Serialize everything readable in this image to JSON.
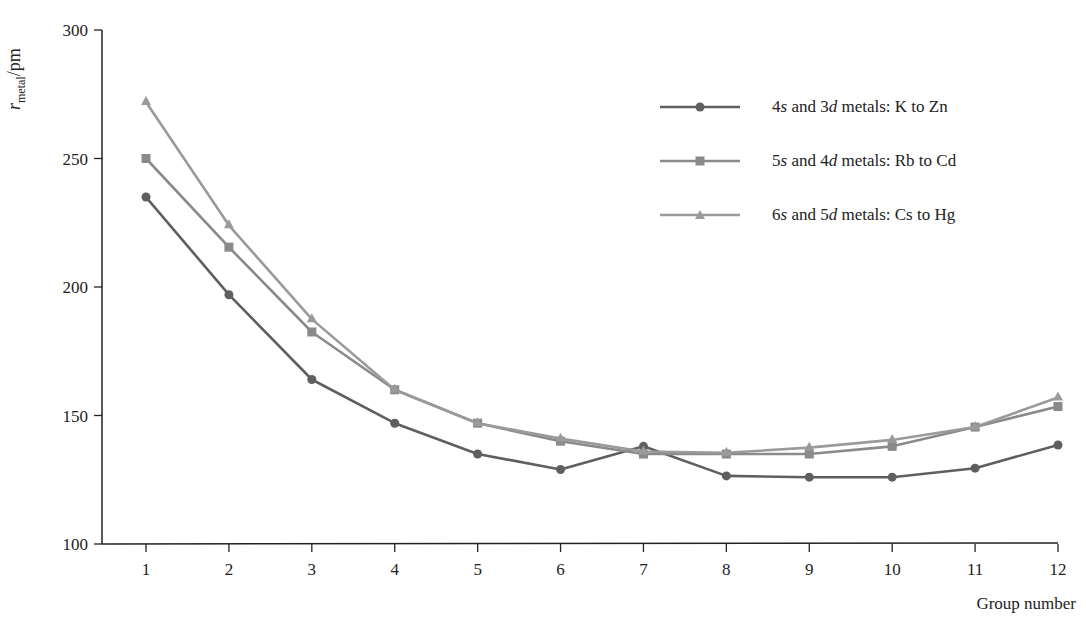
{
  "chart_data": {
    "type": "line",
    "title": "",
    "xlabel": "Group number",
    "ylabel": "r_metal/pm",
    "ylabel_parts": {
      "symbol": "r",
      "subscript": "metal",
      "unit": "/pm"
    },
    "x": [
      1,
      2,
      3,
      4,
      5,
      6,
      7,
      8,
      9,
      10,
      11,
      12
    ],
    "x_tick_labels": [
      "1",
      "2",
      "3",
      "4",
      "5",
      "6",
      "7",
      "8",
      "9",
      "10",
      "11",
      "12"
    ],
    "y_ticks": [
      100,
      150,
      200,
      250,
      300
    ],
    "y_tick_labels": [
      "100",
      "150",
      "200",
      "250",
      "300"
    ],
    "ylim": [
      100,
      300
    ],
    "xlim": [
      0.45,
      12
    ],
    "grid": false,
    "legend_position": "upper right",
    "series": [
      {
        "name": "4s and 3d metals: K to Zn",
        "marker": "circle",
        "color": "#5f5f5f",
        "values": [
          235,
          197,
          164,
          147,
          135,
          129,
          138,
          126.5,
          126,
          126,
          129.5,
          138.5
        ]
      },
      {
        "name": "5s and 4d metals: Rb to Cd",
        "marker": "square",
        "color": "#8a8a8a",
        "values": [
          250,
          215.5,
          182.5,
          160,
          147,
          140,
          135,
          135,
          135,
          138,
          145.5,
          153.5
        ]
      },
      {
        "name": "6s and 5d metals: Cs to Hg",
        "marker": "triangle",
        "color": "#9a9a9a",
        "values": [
          272,
          224,
          187.5,
          160,
          147,
          141,
          136,
          135.5,
          137.5,
          140.5,
          145.5,
          157
        ]
      }
    ]
  },
  "legend": [
    {
      "prefix": "4",
      "s": "s",
      "mid": " and 3",
      "d": "d",
      "suffix": " metals: K to Zn"
    },
    {
      "prefix": "5",
      "s": "s",
      "mid": " and 4",
      "d": "d",
      "suffix": " metals: Rb to Cd"
    },
    {
      "prefix": "6",
      "s": "s",
      "mid": " and 5",
      "d": "d",
      "suffix": " metals: Cs to Hg"
    }
  ],
  "axes": {
    "ylabel_symbol": "r",
    "ylabel_sub": "metal",
    "ylabel_unit": "/pm",
    "xlabel": "Group number"
  }
}
